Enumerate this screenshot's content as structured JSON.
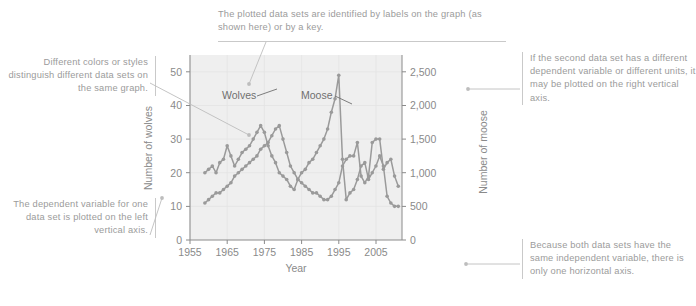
{
  "annotations": {
    "top": {
      "name": "labels-annotation",
      "text": "The plotted data sets are identified by labels on the graph (as shown here) or by a key."
    },
    "left_upper": {
      "name": "colors-styles-annotation",
      "text": "Different colors or styles distinguish different data sets on the same graph."
    },
    "left_lower": {
      "name": "left-axis-annotation",
      "text": "The dependent variable for one data set is plotted on the left vertical axis."
    },
    "right_upper": {
      "name": "right-axis-annotation",
      "text": "If the second data set has a different dependent variable or different units, it may be plotted on the right vertical axis."
    },
    "right_lower": {
      "name": "horizontal-axis-annotation",
      "text": "Because both data sets have the same independent variable, there is only one horizontal axis."
    }
  },
  "chart_data": {
    "type": "line",
    "title": "",
    "xlabel": "Year",
    "ylabel": "Number of wolves",
    "y2label": "Number of moose",
    "grid": true,
    "legend_position": "inline-labels",
    "xlim": [
      1955,
      2012
    ],
    "xticks": [
      1955,
      1965,
      1975,
      1985,
      1995,
      2005
    ],
    "xticklabels": [
      "1955",
      "1965",
      "1975",
      "1985",
      "1995",
      "2005"
    ],
    "ylim": [
      0,
      55
    ],
    "yticks": [
      0,
      10,
      20,
      30,
      40,
      50
    ],
    "yticklabels": [
      "0",
      "10",
      "20",
      "30",
      "40",
      "50"
    ],
    "y2lim": [
      0,
      2750
    ],
    "y2ticks": [
      0,
      500,
      1000,
      1500,
      2000,
      2500
    ],
    "y2ticklabels": [
      "0",
      "500",
      "1,000",
      "1,500",
      "2,000",
      "2,500"
    ],
    "series": [
      {
        "name": "Wolves",
        "axis": "left",
        "color": "#9a9a9a",
        "marker": true,
        "x": [
          1959,
          1960,
          1961,
          1962,
          1963,
          1964,
          1965,
          1966,
          1967,
          1968,
          1969,
          1970,
          1971,
          1972,
          1973,
          1974,
          1975,
          1976,
          1977,
          1978,
          1979,
          1980,
          1981,
          1982,
          1983,
          1984,
          1985,
          1986,
          1987,
          1988,
          1989,
          1990,
          1991,
          1992,
          1993,
          1994,
          1995,
          1996,
          1997,
          1998,
          1999,
          2000,
          2001,
          2002,
          2003,
          2004,
          2005,
          2006,
          2007,
          2008,
          2009,
          2010,
          2011
        ],
        "values": [
          11,
          12,
          13,
          14,
          14,
          15,
          16,
          17,
          19,
          20,
          21,
          22,
          23,
          24,
          25,
          27,
          28,
          29,
          31,
          33,
          34,
          30,
          26,
          22,
          20,
          18,
          17,
          16,
          15,
          14,
          14,
          13,
          12,
          12,
          13,
          15,
          17,
          22,
          24,
          25,
          25,
          29,
          19,
          17,
          19,
          29,
          30,
          30,
          21,
          23,
          24,
          19,
          16
        ]
      },
      {
        "name": "Moose",
        "axis": "right",
        "color": "#9a9a9a",
        "marker": true,
        "x": [
          1959,
          1960,
          1961,
          1962,
          1963,
          1964,
          1965,
          1966,
          1967,
          1968,
          1969,
          1970,
          1971,
          1972,
          1973,
          1974,
          1975,
          1976,
          1977,
          1978,
          1979,
          1980,
          1981,
          1982,
          1983,
          1984,
          1985,
          1986,
          1987,
          1988,
          1989,
          1990,
          1991,
          1992,
          1993,
          1994,
          1995,
          1996,
          1997,
          1998,
          1999,
          2000,
          2001,
          2002,
          2003,
          2004,
          2005,
          2006,
          2007,
          2008,
          2009,
          2010,
          2011
        ],
        "values": [
          1000,
          1050,
          1100,
          1000,
          1150,
          1200,
          1400,
          1250,
          1100,
          1200,
          1300,
          1350,
          1400,
          1500,
          1600,
          1700,
          1600,
          1400,
          1250,
          1150,
          1000,
          950,
          900,
          800,
          750,
          900,
          1000,
          1050,
          1150,
          1200,
          1300,
          1400,
          1500,
          1650,
          1900,
          2100,
          2450,
          1200,
          600,
          700,
          750,
          900,
          1100,
          1150,
          900,
          1000,
          1100,
          1250,
          1100,
          650,
          550,
          500,
          500
        ]
      }
    ],
    "series_labels": [
      {
        "text": "Wolves",
        "name": "wolves-series-label"
      },
      {
        "text": "Moose",
        "name": "moose-series-label"
      }
    ]
  }
}
